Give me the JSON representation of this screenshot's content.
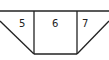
{
  "diagram": {
    "type": "trapezoid-partition",
    "regions": [
      {
        "label": "5"
      },
      {
        "label": "6"
      },
      {
        "label": "7"
      }
    ],
    "stroke_color": "#222222",
    "background": "#ffffff"
  }
}
